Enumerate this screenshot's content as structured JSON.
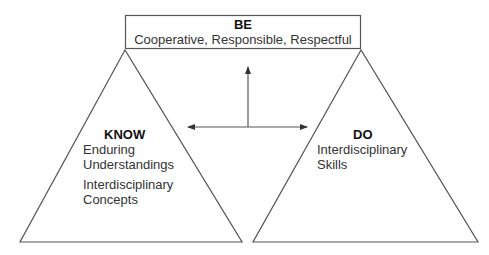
{
  "diagram": {
    "be": {
      "title": "BE",
      "subtitle": "Cooperative, Responsible, Respectful"
    },
    "know": {
      "title": "KNOW",
      "line1": "Enduring",
      "line2": "Understandings",
      "line3": "Interdisciplinary",
      "line4": "Concepts"
    },
    "do": {
      "title": "DO",
      "line1": "Interdisciplinary",
      "line2": "Skills"
    },
    "colors": {
      "stroke": "#555555",
      "text": "#333333",
      "background": "#ffffff"
    }
  }
}
